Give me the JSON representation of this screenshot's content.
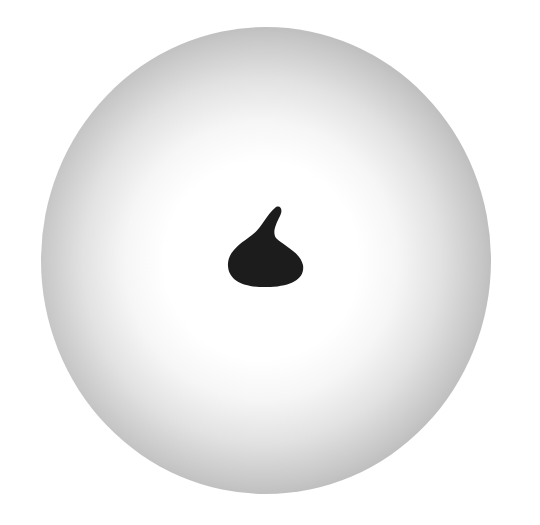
{
  "scene": {
    "background_color": "#ffffff",
    "sphere": {
      "description": "radially shaded grey sphere, white center fading to grey edge",
      "center_color": "#ffffff",
      "edge_color": "#777777"
    },
    "drop": {
      "description": "black teardrop/kiss-shaped blot at center with tip curving up-right",
      "color": "#1c1c1c"
    }
  }
}
